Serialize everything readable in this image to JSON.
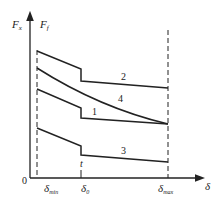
{
  "axes": {
    "y_label_left": "F",
    "y_label_left_sub": "x",
    "y_label_right": "F",
    "y_label_right_sub": "f",
    "x_label": "δ",
    "origin": "0"
  },
  "markers": [
    {
      "label": "δ",
      "sub": "min"
    },
    {
      "label": "δ",
      "sub": "0"
    },
    {
      "label": "δ",
      "sub": "max"
    }
  ],
  "point_label": "t",
  "curves": [
    {
      "id": "2",
      "label": "2"
    },
    {
      "id": "4",
      "label": "4"
    },
    {
      "id": "1",
      "label": "1"
    },
    {
      "id": "3",
      "label": "3"
    }
  ]
}
